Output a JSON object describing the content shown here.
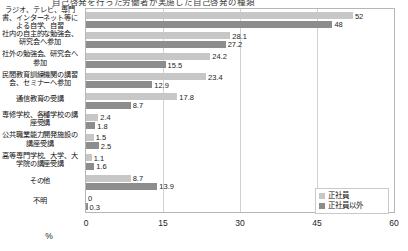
{
  "title": {
    "text": "自己啓発を行った労働者が実施した自己啓発の種類"
  },
  "legend": {
    "position": "bottom-right",
    "items": [
      {
        "label": "正社員",
        "color": "#c7c7c7"
      },
      {
        "label": "正社員以外",
        "color": "#8d8d8d"
      }
    ]
  },
  "axis": {
    "xlabel": "%",
    "ticks": [
      "0",
      "15",
      "30",
      "45",
      "60"
    ]
  },
  "chart_data": {
    "type": "bar",
    "title": "自己啓発を行った労働者が実施した自己啓発の種類",
    "orientation": "horizontal",
    "xlabel": "%",
    "ylabel": "",
    "xlim": [
      0,
      60
    ],
    "xticks": [
      0,
      15,
      30,
      45,
      60
    ],
    "grid": true,
    "legend_position": "bottom-right",
    "categories": [
      "ラジオ、テレビ、専門書、インターネット等による自学、自習",
      "社内の自主的な勉強会、研究会へ参加",
      "社外の勉強会、研究会へ参加",
      "民間教育訓練機関の講習会、セミナーへ参加",
      "通信教育の受講",
      "専修学校、各種学校の講座受講",
      "公共職業能力開発施設の講座受講",
      "高等専門学校、大学、大学院の講座受講",
      "その他",
      "不明"
    ],
    "series": [
      {
        "name": "正社員",
        "color": "#c7c7c7",
        "values": [
          52,
          28.1,
          24.2,
          23.4,
          17.8,
          2.4,
          1.5,
          1.1,
          8.7,
          0
        ],
        "labels": [
          "52",
          "28.1",
          "24.2",
          "23.4",
          "17.8",
          "2.4",
          "1.5",
          "1.1",
          "8.7",
          "0"
        ]
      },
      {
        "name": "正社員以外",
        "color": "#8d8d8d",
        "values": [
          48,
          27.2,
          15.5,
          12.9,
          8.7,
          1.8,
          2.5,
          1.6,
          13.9,
          0.3
        ],
        "labels": [
          "48",
          "27.2",
          "15.5",
          "12.9",
          "8.7",
          "1.8",
          "2.5",
          "1.6",
          "13.9",
          "0.3"
        ]
      }
    ]
  }
}
